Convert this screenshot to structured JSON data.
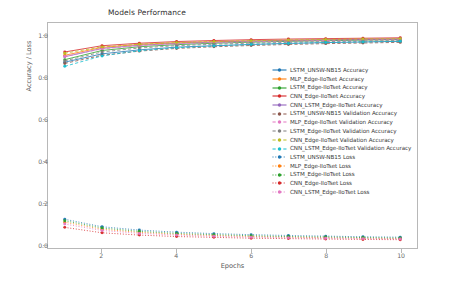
{
  "chart_data": {
    "type": "line",
    "title": "Models Performance",
    "xlabel": "Epochs",
    "ylabel": "Accuracy / Loss",
    "xlim": [
      0.55,
      10.45
    ],
    "ylim": [
      -0.02,
      1.06
    ],
    "xticks": [
      2,
      4,
      6,
      8,
      10
    ],
    "yticks": [
      "0.0",
      "0.2",
      "0.4",
      "0.6",
      "0.8",
      "1.0"
    ],
    "ytick_values": [
      0.0,
      0.2,
      0.4,
      0.6,
      0.8,
      1.0
    ],
    "grid": false,
    "legend_position": "center right",
    "x": [
      1,
      2,
      3,
      4,
      5,
      6,
      7,
      8,
      9,
      10
    ],
    "series": [
      {
        "name": "LSTM_UNSW-NB15 Accuracy",
        "color": "#1f77b4",
        "linestyle": "solid",
        "marker": "o",
        "values": [
          0.872,
          0.912,
          0.931,
          0.944,
          0.951,
          0.957,
          0.962,
          0.966,
          0.969,
          0.972
        ]
      },
      {
        "name": "MLP_Edge-IIoTset Accuracy",
        "color": "#ff7f0e",
        "linestyle": "solid",
        "marker": "o",
        "values": [
          0.905,
          0.943,
          0.957,
          0.965,
          0.97,
          0.974,
          0.977,
          0.98,
          0.982,
          0.984
        ]
      },
      {
        "name": "LSTM_Edge-IIoTset Accuracy",
        "color": "#2ca02c",
        "linestyle": "solid",
        "marker": "o",
        "values": [
          0.884,
          0.928,
          0.946,
          0.956,
          0.963,
          0.968,
          0.972,
          0.975,
          0.978,
          0.98
        ]
      },
      {
        "name": "CNN_Edge-IIoTset Accuracy",
        "color": "#d62728",
        "linestyle": "solid",
        "marker": "o",
        "values": [
          0.921,
          0.951,
          0.963,
          0.971,
          0.976,
          0.98,
          0.983,
          0.985,
          0.987,
          0.989
        ]
      },
      {
        "name": "CNN_LSTM_Edge-IIoTset Accuracy",
        "color": "#9467bd",
        "linestyle": "solid",
        "marker": "o",
        "values": [
          0.898,
          0.938,
          0.953,
          0.962,
          0.968,
          0.973,
          0.976,
          0.979,
          0.981,
          0.983
        ]
      },
      {
        "name": "LSTM_UNSW-NB15 Validation Accuracy",
        "color": "#8c564b",
        "linestyle": "dashed",
        "marker": "o",
        "values": [
          0.866,
          0.905,
          0.925,
          0.938,
          0.946,
          0.952,
          0.957,
          0.961,
          0.964,
          0.967
        ]
      },
      {
        "name": "MLP_Edge-IIoTset Validation Accuracy",
        "color": "#e377c2",
        "linestyle": "dashed",
        "marker": "o",
        "values": [
          0.899,
          0.936,
          0.951,
          0.96,
          0.966,
          0.97,
          0.973,
          0.976,
          0.978,
          0.98
        ]
      },
      {
        "name": "LSTM_Edge-IIoTset Validation Accuracy",
        "color": "#7f7f7f",
        "linestyle": "dashed",
        "marker": "o",
        "values": [
          0.878,
          0.921,
          0.94,
          0.951,
          0.958,
          0.963,
          0.967,
          0.971,
          0.973,
          0.976
        ]
      },
      {
        "name": "CNN_Edge-IIoTset Validation Accuracy",
        "color": "#bcbd22",
        "linestyle": "dashed",
        "marker": "o",
        "values": [
          0.915,
          0.945,
          0.958,
          0.966,
          0.971,
          0.975,
          0.978,
          0.981,
          0.983,
          0.985
        ]
      },
      {
        "name": "CNN_LSTM_Edge-IIoTset Validation Accuracy",
        "color": "#17becf",
        "linestyle": "dashed",
        "marker": "o",
        "values": [
          0.852,
          0.902,
          0.927,
          0.941,
          0.95,
          0.957,
          0.962,
          0.966,
          0.969,
          0.972
        ]
      },
      {
        "name": "LSTM_UNSW-NB15 Loss",
        "color": "#1f77b4",
        "linestyle": "dotted",
        "marker": "o",
        "values": [
          0.118,
          0.082,
          0.066,
          0.056,
          0.049,
          0.044,
          0.04,
          0.037,
          0.034,
          0.032
        ]
      },
      {
        "name": "MLP_Edge-IIoTset Loss",
        "color": "#ff7f0e",
        "linestyle": "dotted",
        "marker": "o",
        "values": [
          0.104,
          0.07,
          0.055,
          0.046,
          0.04,
          0.035,
          0.032,
          0.029,
          0.027,
          0.025
        ]
      },
      {
        "name": "LSTM_Edge-IIoTset Loss",
        "color": "#2ca02c",
        "linestyle": "dotted",
        "marker": "o",
        "values": [
          0.111,
          0.076,
          0.06,
          0.05,
          0.044,
          0.039,
          0.035,
          0.033,
          0.03,
          0.028
        ]
      },
      {
        "name": "CNN_Edge-IIoTset Loss",
        "color": "#d62728",
        "linestyle": "dotted",
        "marker": "o",
        "values": [
          0.079,
          0.053,
          0.042,
          0.035,
          0.031,
          0.027,
          0.025,
          0.023,
          0.021,
          0.02
        ]
      },
      {
        "name": "CNN_LSTM_Edge-IIoTset Loss",
        "color": "#e377c2",
        "linestyle": "dotted",
        "marker": "o",
        "values": [
          0.095,
          0.064,
          0.05,
          0.042,
          0.036,
          0.032,
          0.029,
          0.027,
          0.025,
          0.023
        ]
      }
    ]
  }
}
